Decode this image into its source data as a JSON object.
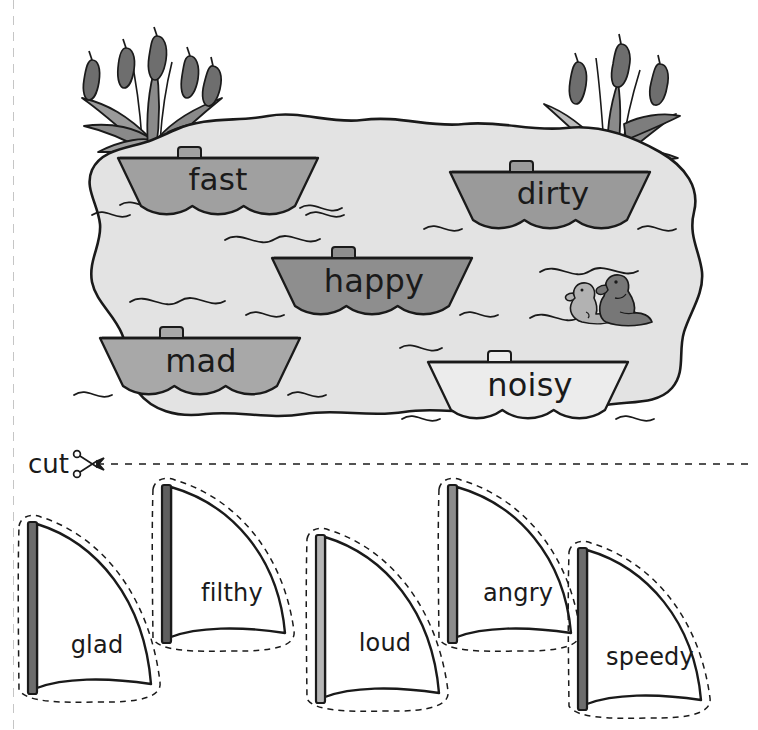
{
  "worksheet": {
    "title": "Synonym Boats",
    "cut_label": "cut",
    "scissors_icon": "scissors-icon"
  },
  "pond": {
    "name": "pond",
    "fill_color": "#e3e3e3",
    "outline_color": "#1a1a1a",
    "wave_color": "#1a1a1a"
  },
  "cattails": {
    "left_name": "cattail-plant-left",
    "right_name": "cattail-plant-right",
    "head_color": "#6e6e6e",
    "leaf_color": "#9a9a9a",
    "leaf_dark_color": "#7d7d7d"
  },
  "ducks": {
    "name": "ducks",
    "duckling_color": "#b2b2b2",
    "duck_color": "#777777"
  },
  "boats": [
    {
      "id": "boat-fast",
      "word": "fast",
      "hull_color": "#a0a0a0",
      "x": 118,
      "y": 158,
      "w": 200,
      "h": 48,
      "text_x": 218,
      "text_y": 190,
      "font_size": 31
    },
    {
      "id": "boat-dirty",
      "word": "dirty",
      "hull_color": "#9a9a9a",
      "x": 450,
      "y": 172,
      "w": 200,
      "h": 48,
      "text_x": 553,
      "text_y": 204,
      "font_size": 31
    },
    {
      "id": "boat-happy",
      "word": "happy",
      "hull_color": "#8e8e8e",
      "x": 272,
      "y": 258,
      "w": 200,
      "h": 48,
      "text_x": 374,
      "text_y": 292,
      "font_size": 32
    },
    {
      "id": "boat-mad",
      "word": "mad",
      "hull_color": "#a8a8a8",
      "x": 100,
      "y": 338,
      "w": 200,
      "h": 48,
      "text_x": 201,
      "text_y": 372,
      "font_size": 32
    },
    {
      "id": "boat-noisy",
      "word": "noisy",
      "hull_color": "#ececec",
      "x": 428,
      "y": 362,
      "w": 200,
      "h": 48,
      "text_x": 530,
      "text_y": 396,
      "font_size": 32
    }
  ],
  "sails": [
    {
      "id": "sail-glad",
      "word": "glad",
      "mast_color": "#6d6d6d",
      "sail_color": "#ffffff",
      "x": 28,
      "y": 522,
      "w": 125,
      "h": 172,
      "text_x": 97,
      "text_y": 653,
      "font_size": 24
    },
    {
      "id": "sail-filthy",
      "word": "filthy",
      "mast_color": "#5f5f5f",
      "sail_color": "#ffffff",
      "x": 162,
      "y": 485,
      "w": 125,
      "h": 158,
      "text_x": 232,
      "text_y": 601,
      "font_size": 24
    },
    {
      "id": "sail-loud",
      "word": "loud",
      "mast_color": "#b6b6b6",
      "sail_color": "#ffffff",
      "x": 316,
      "y": 535,
      "w": 125,
      "h": 168,
      "text_x": 385,
      "text_y": 651,
      "font_size": 24
    },
    {
      "id": "sail-angry",
      "word": "angry",
      "mast_color": "#8c8c8c",
      "sail_color": "#ffffff",
      "x": 448,
      "y": 485,
      "w": 125,
      "h": 158,
      "text_x": 518,
      "text_y": 601,
      "font_size": 24
    },
    {
      "id": "sail-speedy",
      "word": "speedy",
      "mast_color": "#6d6d6d",
      "sail_color": "#ffffff",
      "x": 578,
      "y": 548,
      "w": 125,
      "h": 162,
      "text_x": 650,
      "text_y": 665,
      "font_size": 24
    }
  ],
  "cut_line": {
    "name": "cut-dashed-line",
    "from_x": 97,
    "to_x": 748,
    "y": 464
  }
}
